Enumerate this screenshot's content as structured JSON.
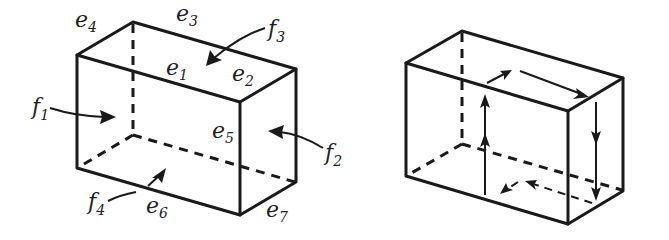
{
  "figure": {
    "left_box": {
      "edge_labels": [
        {
          "id": "e1",
          "base": "e",
          "sub": "1"
        },
        {
          "id": "e2",
          "base": "e",
          "sub": "2"
        },
        {
          "id": "e3",
          "base": "e",
          "sub": "3"
        },
        {
          "id": "e4",
          "base": "e",
          "sub": "4"
        },
        {
          "id": "e5",
          "base": "e",
          "sub": "5"
        },
        {
          "id": "e6",
          "base": "e",
          "sub": "6"
        },
        {
          "id": "e7",
          "base": "e",
          "sub": "7"
        }
      ],
      "face_labels": [
        {
          "id": "f1",
          "base": "f",
          "sub": "1"
        },
        {
          "id": "f2",
          "base": "f",
          "sub": "2"
        },
        {
          "id": "f3",
          "base": "f",
          "sub": "3"
        },
        {
          "id": "f4",
          "base": "f",
          "sub": "4"
        }
      ]
    },
    "right_box": {
      "description": "Box with a closed oriented loop of arrows traversing its faces"
    }
  }
}
